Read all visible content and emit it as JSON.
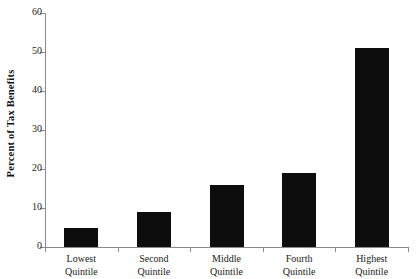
{
  "chart_data": {
    "type": "bar",
    "title": "",
    "xlabel": "",
    "ylabel": "Percent of Tax Benefits",
    "ylim": [
      0,
      60
    ],
    "yticks": [
      0,
      10,
      20,
      30,
      40,
      50,
      60
    ],
    "grid": false,
    "legend": false,
    "bar_color": "#0d0d0d",
    "axis_color": "#8a8a8a",
    "categories": [
      "Lowest Quintile",
      "Second Quintile",
      "Middle Quintile",
      "Fourth Quintile",
      "Highest Quintile"
    ],
    "category_lines": [
      {
        "line1": "Lowest",
        "line2": "Quintile"
      },
      {
        "line1": "Second",
        "line2": "Quintile"
      },
      {
        "line1": "Middle",
        "line2": "Quintile"
      },
      {
        "line1": "Fourth",
        "line2": "Quintile"
      },
      {
        "line1": "Highest",
        "line2": "Quintile"
      }
    ],
    "values": [
      5,
      9,
      16,
      19,
      51
    ]
  }
}
